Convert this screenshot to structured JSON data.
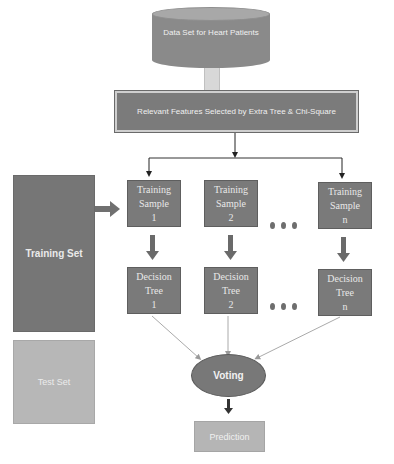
{
  "diagram": {
    "database": {
      "label": "Data Set for Heart Patients",
      "icon": "database-cylinder"
    },
    "feature_selection": {
      "label": "Relevant Features Selected by Extra Tree & Chi-Square"
    },
    "training_set": {
      "label": "Training Set"
    },
    "test_set": {
      "label": "Test Set"
    },
    "samples": [
      {
        "line1": "Training",
        "line2": "Sample",
        "line3": "1"
      },
      {
        "line1": "Training",
        "line2": "Sample",
        "line3": "2"
      },
      {
        "line1": "Training",
        "line2": "Sample",
        "line3": "n"
      }
    ],
    "trees": [
      {
        "line1": "Decision",
        "line2": "Tree",
        "line3": "1"
      },
      {
        "line1": "Decision",
        "line2": "Tree",
        "line3": "2"
      },
      {
        "line1": "Decision",
        "line2": "Tree",
        "line3": "n"
      }
    ],
    "ellipsis": "• • •",
    "voting": {
      "label": "Voting"
    },
    "prediction": {
      "label": "Prediction"
    },
    "colors": {
      "dark_box": "#7a7a7a",
      "light_box": "#b5b5b5",
      "voting": "#7a7a7a",
      "arrow": "#555555",
      "thin_arrow": "#a8a8a8"
    }
  }
}
